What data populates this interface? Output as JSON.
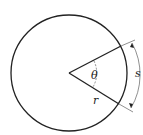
{
  "diagram": {
    "labels": {
      "angle": "θ",
      "radius": "r",
      "arc_length": "s"
    },
    "colors": {
      "stroke": "#222222",
      "background": "#ffffff"
    }
  }
}
